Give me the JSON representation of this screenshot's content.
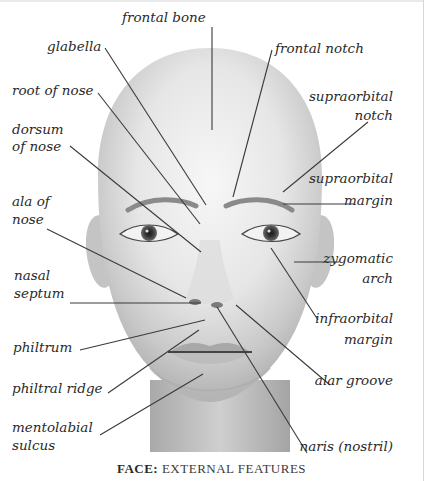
{
  "figure": {
    "caption_bold": "FACE:",
    "caption_rest": " EXTERNAL FEATURES",
    "colors": {
      "leader_line": "#3a3a3a",
      "text": "#2a2a2a",
      "background": "#ffffff"
    }
  },
  "labels": {
    "frontal_bone": "frontal bone",
    "glabella": "glabella",
    "frontal_notch": "frontal notch",
    "root_of_nose": "root of nose",
    "supraorbital_notch_1": "supraorbital",
    "supraorbital_notch_2": "notch",
    "dorsum_of_nose_1": "dorsum",
    "dorsum_of_nose_2": "of nose",
    "supraorbital_margin_1": "supraorbital",
    "supraorbital_margin_2": "margin",
    "ala_of_nose_1": "ala of",
    "ala_of_nose_2": "nose",
    "zygomatic_arch_1": "zygomatic",
    "zygomatic_arch_2": "arch",
    "nasal_septum_1": "nasal",
    "nasal_septum_2": "septum",
    "infraorbital_margin_1": "infraorbital",
    "infraorbital_margin_2": "margin",
    "philtrum": "philtrum",
    "alar_groove": "alar groove",
    "philtral_ridge": "philtral ridge",
    "mentolabial_sulcus_1": "mentolabial",
    "mentolabial_sulcus_2": "sulcus",
    "naris": "naris (nostril)"
  }
}
